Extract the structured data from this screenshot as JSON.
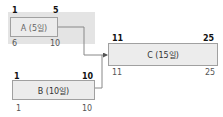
{
  "tasks": [
    {
      "id": "A",
      "label": "A (5일)",
      "early_start": "1",
      "early_finish": "5",
      "late_start": "6",
      "late_finish": "10"
    },
    {
      "id": "B",
      "label": "B (10일)",
      "early_start": "1",
      "early_finish": "10",
      "late_start": "1",
      "late_finish": "10"
    },
    {
      "id": "C",
      "label": "C (15일)",
      "early_start": "11",
      "early_finish": "25",
      "late_start": "11",
      "late_finish": "25"
    }
  ]
}
